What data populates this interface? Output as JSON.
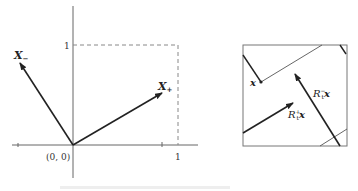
{
  "left_panel": {
    "origin_label": "(0, 0)",
    "x_tick_label": "1",
    "y_tick_label": "1",
    "vector_minus_label": "X",
    "vector_minus_sub": "−",
    "vector_plus_label": "X",
    "vector_plus_sub": "+"
  },
  "right_panel": {
    "point_label": "x",
    "vector_a_label_R": "R",
    "vector_a_label_sub": "t",
    "vector_a_label_sup": "+",
    "vector_a_label_x": "x",
    "vector_b_label_R": "R",
    "vector_b_label_sub": "t",
    "vector_b_label_sup": "−",
    "vector_b_label_x": "x"
  },
  "caption": "(caption text cut off / illegible)"
}
